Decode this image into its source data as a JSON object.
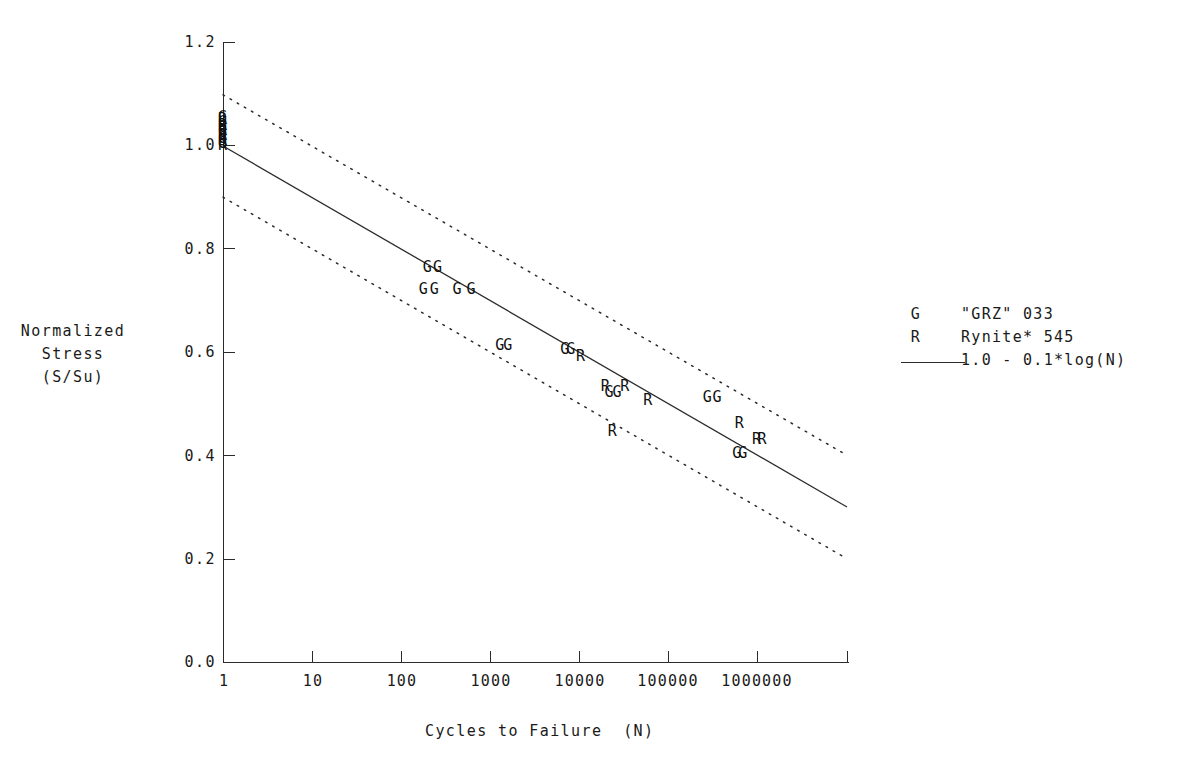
{
  "chart_data": {
    "type": "scatter",
    "title": "",
    "xlabel": "Cycles to Failure  (N)",
    "ylabel": "Normalized\nStress\n(S/Su)",
    "xscale": "log",
    "xlim": [
      1,
      10000000
    ],
    "ylim": [
      0.0,
      1.2
    ],
    "xticks": [
      1,
      10,
      100,
      1000,
      10000,
      100000,
      1000000
    ],
    "xtick_labels": [
      "1",
      "10",
      "100",
      "1000",
      "10000",
      "100000",
      "1000000"
    ],
    "yticks": [
      0.0,
      0.2,
      0.4,
      0.6,
      0.8,
      1.0,
      1.2
    ],
    "ytick_labels": [
      "0.0",
      "0.2",
      "0.4",
      "0.6",
      "0.8",
      "1.0",
      "1.2"
    ],
    "grid": false,
    "legend_position": "right",
    "legend": [
      {
        "key": "G",
        "label": "\"GRZ\" 033",
        "kind": "marker"
      },
      {
        "key": "R",
        "label": "Rynite* 545",
        "kind": "marker"
      },
      {
        "key": "line",
        "label": "1.0 - 0.1*log(N)",
        "kind": "line"
      }
    ],
    "trend_line": {
      "label": "1.0 - 0.1*log(N)",
      "intercept": 1.0,
      "slope_per_decade": -0.1,
      "x_start": 1,
      "x_end": 10000000,
      "y_start": 1.0,
      "y_end": 0.3,
      "style": "solid"
    },
    "bands": [
      {
        "name": "upper-bound",
        "offset": 0.1,
        "y_start": 1.1,
        "y_end": 0.4,
        "style": "dotted"
      },
      {
        "name": "lower-bound",
        "offset": -0.1,
        "y_start": 0.9,
        "y_end": 0.2,
        "style": "dotted"
      }
    ],
    "series": [
      {
        "name": "\"GRZ\" 033",
        "key": "G",
        "points": [
          {
            "x": 1,
            "y": 1.055
          },
          {
            "x": 1,
            "y": 1.045
          },
          {
            "x": 1,
            "y": 1.035
          },
          {
            "x": 1,
            "y": 1.025
          },
          {
            "x": 1,
            "y": 1.015
          },
          {
            "x": 1,
            "y": 1.005
          },
          {
            "x": 200,
            "y": 0.765
          },
          {
            "x": 260,
            "y": 0.765
          },
          {
            "x": 180,
            "y": 0.722
          },
          {
            "x": 240,
            "y": 0.722
          },
          {
            "x": 430,
            "y": 0.722
          },
          {
            "x": 620,
            "y": 0.722
          },
          {
            "x": 1300,
            "y": 0.613
          },
          {
            "x": 1600,
            "y": 0.613
          },
          {
            "x": 7000,
            "y": 0.606
          },
          {
            "x": 8200,
            "y": 0.606
          },
          {
            "x": 22000,
            "y": 0.522
          },
          {
            "x": 27000,
            "y": 0.522
          },
          {
            "x": 280000,
            "y": 0.513
          },
          {
            "x": 360000,
            "y": 0.513
          },
          {
            "x": 600000,
            "y": 0.405
          },
          {
            "x": 700000,
            "y": 0.405
          }
        ]
      },
      {
        "name": "Rynite* 545",
        "key": "R",
        "points": [
          {
            "x": 1,
            "y": 1.05
          },
          {
            "x": 1,
            "y": 1.04
          },
          {
            "x": 1,
            "y": 1.03
          },
          {
            "x": 1,
            "y": 1.02
          },
          {
            "x": 1,
            "y": 1.01
          },
          {
            "x": 1,
            "y": 1.0
          },
          {
            "x": 10500,
            "y": 0.592
          },
          {
            "x": 20000,
            "y": 0.535
          },
          {
            "x": 33000,
            "y": 0.535
          },
          {
            "x": 60000,
            "y": 0.508
          },
          {
            "x": 24000,
            "y": 0.448
          },
          {
            "x": 640000,
            "y": 0.462
          },
          {
            "x": 1000000,
            "y": 0.432
          },
          {
            "x": 1150000,
            "y": 0.432
          }
        ]
      }
    ]
  },
  "figure": {
    "background": "#ffffff",
    "ink": "#1a1a1a",
    "line_color": "#2b2b2b"
  }
}
